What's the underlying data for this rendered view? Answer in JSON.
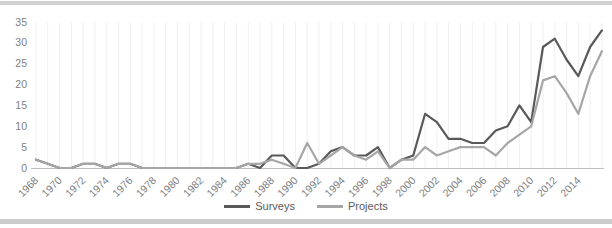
{
  "chart_data": {
    "type": "line",
    "title": "",
    "xlabel": "",
    "ylabel": "",
    "x": [
      1968,
      1969,
      1970,
      1971,
      1972,
      1973,
      1974,
      1975,
      1976,
      1977,
      1978,
      1979,
      1980,
      1981,
      1982,
      1983,
      1984,
      1985,
      1986,
      1987,
      1988,
      1989,
      1990,
      1991,
      1992,
      1993,
      1994,
      1995,
      1996,
      1997,
      1998,
      1999,
      2000,
      2001,
      2002,
      2003,
      2004,
      2005,
      2006,
      2007,
      2008,
      2009,
      2010,
      2011,
      2012,
      2013,
      2014,
      2015,
      2016
    ],
    "series": [
      {
        "name": "Surveys",
        "color": "#595959",
        "values": [
          2,
          1,
          0,
          0,
          1,
          1,
          0,
          1,
          1,
          0,
          0,
          0,
          0,
          0,
          0,
          0,
          0,
          0,
          1,
          0,
          3,
          3,
          0,
          0,
          1,
          4,
          5,
          3,
          3,
          5,
          0,
          2,
          3,
          13,
          11,
          7,
          7,
          6,
          6,
          9,
          10,
          15,
          11,
          29,
          31,
          26,
          22,
          29,
          33
        ]
      },
      {
        "name": "Projects",
        "color": "#a6a6a6",
        "values": [
          2,
          1,
          0,
          0,
          1,
          1,
          0,
          1,
          1,
          0,
          0,
          0,
          0,
          0,
          0,
          0,
          0,
          0,
          1,
          1,
          2,
          1,
          0,
          6,
          1,
          3,
          5,
          3,
          2,
          4,
          0,
          2,
          2,
          5,
          3,
          4,
          5,
          5,
          5,
          3,
          6,
          8,
          10,
          21,
          22,
          18,
          13,
          22,
          28
        ]
      }
    ],
    "ylim": [
      0,
      35
    ],
    "yticks": [
      0,
      5,
      10,
      15,
      20,
      25,
      30,
      35
    ],
    "xtick_labels": [
      "1968",
      "1970",
      "1972",
      "1974",
      "1976",
      "1978",
      "1980",
      "1982",
      "1984",
      "1986",
      "1988",
      "1990",
      "1992",
      "1994",
      "1996",
      "1998",
      "2000",
      "2002",
      "2004",
      "2006",
      "2008",
      "2010",
      "2012",
      "2014"
    ],
    "legend_position": "bottom",
    "grid": "vertical-faint",
    "colors": {
      "axis_text": "#7f7f7f",
      "axis_line": "#bfbfbf",
      "gridline": "#efefef"
    }
  }
}
